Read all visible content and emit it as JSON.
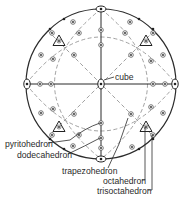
{
  "diagram": {
    "type": "stereographic-projection",
    "center": [
      101,
      84
    ],
    "radius": 75,
    "colors": {
      "line": "#2b2b2b",
      "dash": "#8a8a8a",
      "background": "#ffffff"
    },
    "labels": {
      "cube": "cube",
      "pyritohedron": "pyritohedron",
      "dodecahedron": "dodecahedron",
      "trapezohedron": "trapezohedron",
      "octahedron": "octahedron",
      "trisoctahedron": "trisoctahedron"
    }
  }
}
